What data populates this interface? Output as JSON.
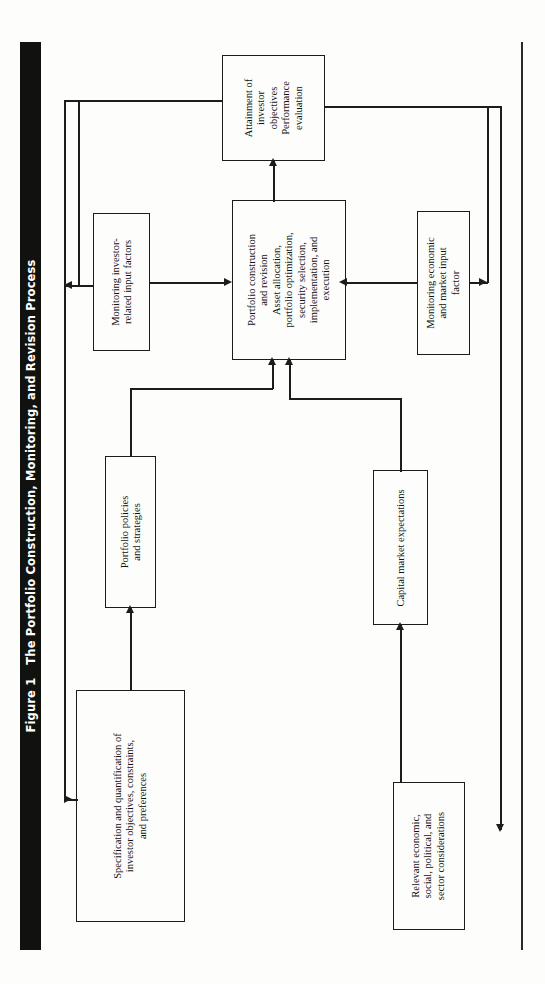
{
  "figure": {
    "number_label": "Figure 1",
    "title": "The Portfolio Construction, Monitoring, and Revision Process",
    "orientation": "rotated-90-ccw",
    "bar_color": "#111110",
    "bar_text_color": "#ffffff",
    "line_color": "#1c1c1a",
    "background": "#fdfdfb"
  },
  "diagram_data": {
    "type": "flowchart",
    "nodes": [
      {
        "id": "attainment",
        "lines": [
          "Attainment of",
          "investor",
          "objectives"
        ],
        "lines2": [
          "Performance",
          "evaluation"
        ]
      },
      {
        "id": "monitoring-investor",
        "lines": [
          "Monitoring investor-",
          "related input factors"
        ]
      },
      {
        "id": "portfolio-construction",
        "lines": [
          "Portfolio construction",
          "and revision"
        ],
        "lines2": [
          "Asset allocation,",
          "portfolio optimization,",
          "security selection,",
          "implementation, and",
          "execution"
        ]
      },
      {
        "id": "monitoring-economic",
        "lines": [
          "Monitoring economic",
          "and market input",
          "factor"
        ]
      },
      {
        "id": "portfolio-policies",
        "lines": [
          "Portfolio policies",
          "and strategies"
        ]
      },
      {
        "id": "capital-market",
        "lines": [
          "Capital market expectations"
        ]
      },
      {
        "id": "specification",
        "lines": [
          "Specification and quantification of",
          "investor objectives, constraints,",
          "and preferences"
        ]
      },
      {
        "id": "relevant-economic",
        "lines": [
          "Relevant economic,",
          "social, political, and",
          "sector considerations"
        ]
      }
    ],
    "edges": [
      {
        "from": "specification",
        "to": "portfolio-policies",
        "arrow": "single"
      },
      {
        "from": "portfolio-policies",
        "to": "portfolio-construction",
        "arrow": "single"
      },
      {
        "from": "relevant-economic",
        "to": "capital-market",
        "arrow": "single"
      },
      {
        "from": "capital-market",
        "to": "portfolio-construction",
        "arrow": "single"
      },
      {
        "from": "portfolio-construction",
        "to": "attainment",
        "arrow": "single"
      },
      {
        "from": "attainment",
        "to": "monitoring-investor",
        "arrow": "single"
      },
      {
        "from": "attainment",
        "to": "monitoring-economic",
        "arrow": "single"
      },
      {
        "from": "monitoring-investor",
        "to": "portfolio-construction",
        "arrow": "single"
      },
      {
        "from": "monitoring-economic",
        "to": "portfolio-construction",
        "arrow": "single"
      },
      {
        "from": "specification",
        "to": "monitoring-investor",
        "arrow": "single"
      },
      {
        "from": "relevant-economic",
        "to": "monitoring-economic",
        "arrow": "single"
      }
    ]
  }
}
